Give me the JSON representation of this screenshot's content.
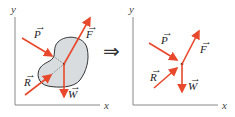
{
  "diagram": {
    "title": "",
    "implies_symbol": "⇒",
    "colors": {
      "force": "#e8482c",
      "axis": "#888888",
      "body_fill": "#d9dcdf",
      "body_stroke": "#333333"
    },
    "left_panel": {
      "axis_x_label": "x",
      "axis_y_label": "y",
      "body": "irregular rigid body (blob)",
      "forces": [
        {
          "name": "P",
          "label": "P",
          "vector_mark": "→"
        },
        {
          "name": "F",
          "label": "F",
          "vector_mark": "→"
        },
        {
          "name": "R",
          "label": "R",
          "vector_mark": "→"
        },
        {
          "name": "W",
          "label": "W",
          "vector_mark": "→"
        }
      ]
    },
    "right_panel": {
      "axis_x_label": "x",
      "axis_y_label": "y",
      "body": "particle (point)",
      "forces": [
        {
          "name": "P",
          "label": "P",
          "vector_mark": "→"
        },
        {
          "name": "F",
          "label": "F",
          "vector_mark": "→"
        },
        {
          "name": "R",
          "label": "R",
          "vector_mark": "→"
        },
        {
          "name": "W",
          "label": "W",
          "vector_mark": "→"
        }
      ]
    }
  }
}
